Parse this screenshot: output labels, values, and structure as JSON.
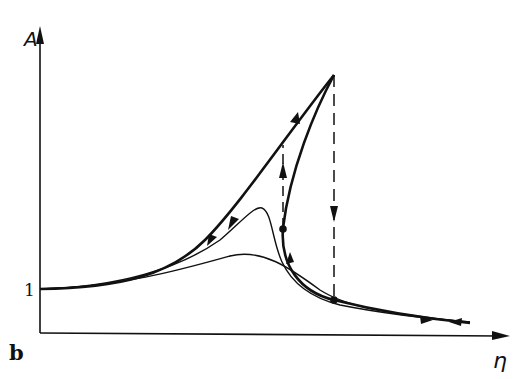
{
  "figure": {
    "panel_label": "b",
    "y_axis_label": "A",
    "x_axis_label": "η",
    "y_tick_label": "1"
  },
  "colors": {
    "ink": "#111111",
    "background": "#ffffff"
  },
  "curves": [
    {
      "name": "linear-resonance-curve",
      "style": "thin"
    },
    {
      "name": "intermediate-resonance-curve",
      "style": "thin"
    },
    {
      "name": "nonlinear-backbone-curve",
      "style": "thick",
      "arrows": true
    },
    {
      "name": "jump-down-line",
      "style": "dashed",
      "direction": "down"
    },
    {
      "name": "jump-up-line",
      "style": "dashed",
      "direction": "up"
    }
  ]
}
